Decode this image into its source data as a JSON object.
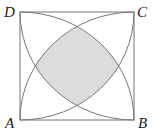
{
  "diagram": {
    "type": "square-with-four-quarter-circle-arcs",
    "labels": {
      "top_left": "D",
      "top_right": "C",
      "bottom_left": "A",
      "bottom_right": "B"
    },
    "colors": {
      "stroke": "#777777",
      "shaded_region": "#dcdcdc",
      "background": "#ffffff"
    }
  }
}
